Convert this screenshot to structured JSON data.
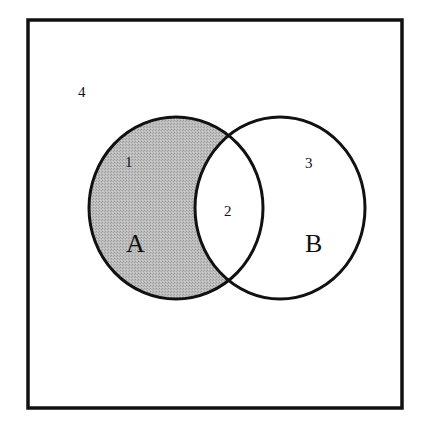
{
  "diagram": {
    "type": "venn",
    "title": "",
    "universe": {
      "region_label": "4",
      "border_color": "#111111"
    },
    "sets": [
      {
        "name": "A",
        "label": "A",
        "shaded": true
      },
      {
        "name": "B",
        "label": "B",
        "shaded": false
      }
    ],
    "regions": [
      {
        "id": "1",
        "label": "1",
        "description": "A only",
        "shaded": true
      },
      {
        "id": "2",
        "label": "2",
        "description": "A and B",
        "shaded": false
      },
      {
        "id": "3",
        "label": "3",
        "description": "B only",
        "shaded": false
      },
      {
        "id": "4",
        "label": "4",
        "description": "neither A nor B",
        "shaded": false
      }
    ],
    "shaded_expression": "A − B",
    "colors": {
      "shade_fill": "#b5b5b5",
      "stroke": "#111111",
      "background": "#ffffff"
    }
  }
}
